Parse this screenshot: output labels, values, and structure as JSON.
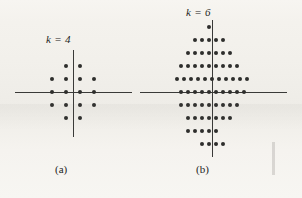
{
  "figure": {
    "background_color": "#f3f1ec",
    "ink_color": "#2e2e2c",
    "panels": [
      {
        "id": "a",
        "label": "k = 4",
        "caption": "(a)",
        "label_left": 46,
        "label_top": 33,
        "caption_left": 55,
        "caption_top": 163,
        "origin_x": 73,
        "origin_y": 92,
        "axis_h_left": 15,
        "axis_h_width": 117,
        "axis_v_top": 50,
        "axis_v_height": 87,
        "spacing_x": 14,
        "spacing_y": 13,
        "point_count": 16
      },
      {
        "id": "b",
        "label": "k = 6",
        "caption": "(b)",
        "label_left": 186,
        "label_top": 6,
        "caption_left": 196,
        "caption_top": 163,
        "origin_x": 212,
        "origin_y": 92,
        "axis_h_left": 140,
        "axis_h_width": 147,
        "axis_v_top": 20,
        "axis_v_height": 137,
        "spacing_x": 14,
        "spacing_y": 13,
        "point_count": 64
      }
    ],
    "edge_note_lines": [
      "",
      "",
      ""
    ]
  },
  "chart_data": {
    "type": "scatter",
    "xlabel": "",
    "ylabel": "",
    "grid": false,
    "legend": "none",
    "axes": "cartesian cross through origin, no tick labels",
    "subplots": [
      {
        "id": "a",
        "annotation": "k = 4",
        "caption": "(a)",
        "description": "16-point cross/diamond constellation, 4 bits per symbol",
        "points_per_row": [
          2,
          4,
          4,
          4,
          2
        ],
        "row_y": [
          2,
          1,
          0,
          -1,
          -2
        ],
        "points": [
          [
            -1,
            2
          ],
          [
            1,
            2
          ],
          [
            -3,
            1
          ],
          [
            -1,
            1
          ],
          [
            1,
            1
          ],
          [
            3,
            1
          ],
          [
            -3,
            0
          ],
          [
            -1,
            0
          ],
          [
            1,
            0
          ],
          [
            3,
            0
          ],
          [
            -3,
            -1
          ],
          [
            -1,
            -1
          ],
          [
            1,
            -1
          ],
          [
            3,
            -1
          ],
          [
            -1,
            -2
          ],
          [
            1,
            -2
          ]
        ]
      },
      {
        "id": "b",
        "annotation": "k = 6",
        "caption": "(b)",
        "description": "64-point triangular/hexagonal lattice constellation, 6 bits per symbol, rows offset by half spacing",
        "points_per_row": [
          1,
          5,
          7,
          9,
          11,
          10,
          9,
          7,
          5,
          4
        ],
        "row_y": [
          5,
          4,
          3,
          2,
          1,
          0,
          -1,
          -2,
          -3,
          -4
        ],
        "points": [
          [
            -0.5,
            5
          ],
          [
            -2.5,
            4
          ],
          [
            -1.5,
            4
          ],
          [
            -0.5,
            4
          ],
          [
            0.5,
            4
          ],
          [
            1.5,
            4
          ],
          [
            -3.5,
            3
          ],
          [
            -2.5,
            3
          ],
          [
            -1.5,
            3
          ],
          [
            -0.5,
            3
          ],
          [
            0.5,
            3
          ],
          [
            1.5,
            3
          ],
          [
            2.5,
            3
          ],
          [
            -4.5,
            2
          ],
          [
            -3.5,
            2
          ],
          [
            -2.5,
            2
          ],
          [
            -1.5,
            2
          ],
          [
            -0.5,
            2
          ],
          [
            0.5,
            2
          ],
          [
            1.5,
            2
          ],
          [
            2.5,
            2
          ],
          [
            3.5,
            2
          ],
          [
            -5,
            1
          ],
          [
            -4,
            1
          ],
          [
            -3,
            1
          ],
          [
            -2,
            1
          ],
          [
            -1,
            1
          ],
          [
            0,
            1
          ],
          [
            1,
            1
          ],
          [
            2,
            1
          ],
          [
            3,
            1
          ],
          [
            4,
            1
          ],
          [
            5,
            1
          ],
          [
            -4.5,
            0
          ],
          [
            -3.5,
            0
          ],
          [
            -2.5,
            0
          ],
          [
            -1.5,
            0
          ],
          [
            -0.5,
            0
          ],
          [
            0.5,
            0
          ],
          [
            1.5,
            0
          ],
          [
            2.5,
            0
          ],
          [
            3.5,
            0
          ],
          [
            4.5,
            0
          ],
          [
            -4.5,
            -1
          ],
          [
            -3.5,
            -1
          ],
          [
            -2.5,
            -1
          ],
          [
            -1.5,
            -1
          ],
          [
            -0.5,
            -1
          ],
          [
            0.5,
            -1
          ],
          [
            1.5,
            -1
          ],
          [
            2.5,
            -1
          ],
          [
            3.5,
            -1
          ],
          [
            -3.5,
            -2
          ],
          [
            -2.5,
            -2
          ],
          [
            -1.5,
            -2
          ],
          [
            -0.5,
            -2
          ],
          [
            0.5,
            -2
          ],
          [
            1.5,
            -2
          ],
          [
            2.5,
            -2
          ],
          [
            -3.5,
            -3
          ],
          [
            -2.5,
            -3
          ],
          [
            -1.5,
            -3
          ],
          [
            -0.5,
            -3
          ],
          [
            0.5,
            -3
          ],
          [
            -1.5,
            -4
          ],
          [
            -0.5,
            -4
          ],
          [
            0.5,
            -4
          ],
          [
            1.5,
            -4
          ]
        ]
      }
    ]
  }
}
